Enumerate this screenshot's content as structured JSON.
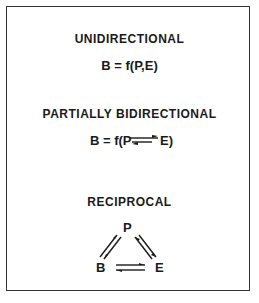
{
  "sections": [
    {
      "title": "UNIDIRECTIONAL",
      "formula": "B = f(P,E)"
    },
    {
      "title": "PARTIALLY BIDIRECTIONAL",
      "formula_prefix": "B = f(P",
      "formula_suffix": "E)"
    },
    {
      "title": "RECIPROCAL",
      "nodes": {
        "top": "P",
        "left": "B",
        "right": "E"
      }
    }
  ]
}
